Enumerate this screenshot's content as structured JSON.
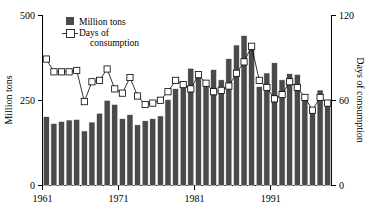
{
  "chart_data": {
    "type": "bar",
    "title": "",
    "subtitle": "",
    "xlabel": "",
    "ylabel": "Million tons",
    "y2label": "Days of consumption",
    "xlim": [
      1960.4,
      1998.6
    ],
    "ylim": [
      0,
      500
    ],
    "y2lim": [
      0,
      120
    ],
    "grid": false,
    "legend_position": "top-left",
    "x_ticks": [
      "1961",
      "1971",
      "1981",
      "1991"
    ],
    "x_tick_values": [
      1961,
      1971,
      1981,
      1991
    ],
    "y_ticks": [
      "0",
      "250",
      "500"
    ],
    "y_tick_values": [
      0,
      250,
      500
    ],
    "y2_ticks": [
      "0",
      "60",
      "120"
    ],
    "y2_tick_values": [
      0,
      60,
      120
    ],
    "categories": [
      1961,
      1962,
      1963,
      1964,
      1965,
      1966,
      1967,
      1968,
      1969,
      1970,
      1971,
      1972,
      1973,
      1974,
      1975,
      1976,
      1977,
      1978,
      1979,
      1980,
      1981,
      1982,
      1983,
      1984,
      1985,
      1986,
      1987,
      1988,
      1989,
      1990,
      1991,
      1992,
      1993,
      1994,
      1995,
      1996,
      1997,
      1998
    ],
    "series": [
      {
        "name": "Million tons",
        "axis": "left",
        "type": "bar",
        "color": "#4a4a4a",
        "values": [
          202,
          182,
          188,
          192,
          194,
          160,
          186,
          212,
          250,
          238,
          196,
          208,
          178,
          190,
          196,
          204,
          252,
          284,
          290,
          344,
          330,
          306,
          340,
          310,
          372,
          412,
          440,
          400,
          290,
          330,
          360,
          310,
          328,
          326,
          260,
          224,
          280,
          244
        ]
      },
      {
        "name": "Days of consumption",
        "axis": "right",
        "type": "line",
        "marker": "open-square",
        "color": "#000000",
        "values": [
          89,
          80,
          80,
          80,
          81,
          59,
          73,
          74,
          82,
          68,
          65,
          76,
          63,
          57,
          58,
          60,
          66,
          74,
          71,
          68,
          78,
          72,
          66,
          67,
          70,
          79,
          87,
          98,
          74,
          69,
          61,
          64,
          73,
          69,
          62,
          53,
          62,
          58
        ]
      }
    ],
    "legend": [
      {
        "label": "Million tons",
        "marker": "filled-square",
        "color": "#4a4a4a"
      },
      {
        "label": "Days of consumption",
        "marker": "open-square-line",
        "color": "#000000"
      }
    ]
  },
  "legend": {
    "bars_label": "Million tons",
    "line_label_line1": "Days of",
    "line_label_line2": "consumption"
  },
  "axes": {
    "left_title": "Million tons",
    "right_title": "Days of consumption"
  }
}
